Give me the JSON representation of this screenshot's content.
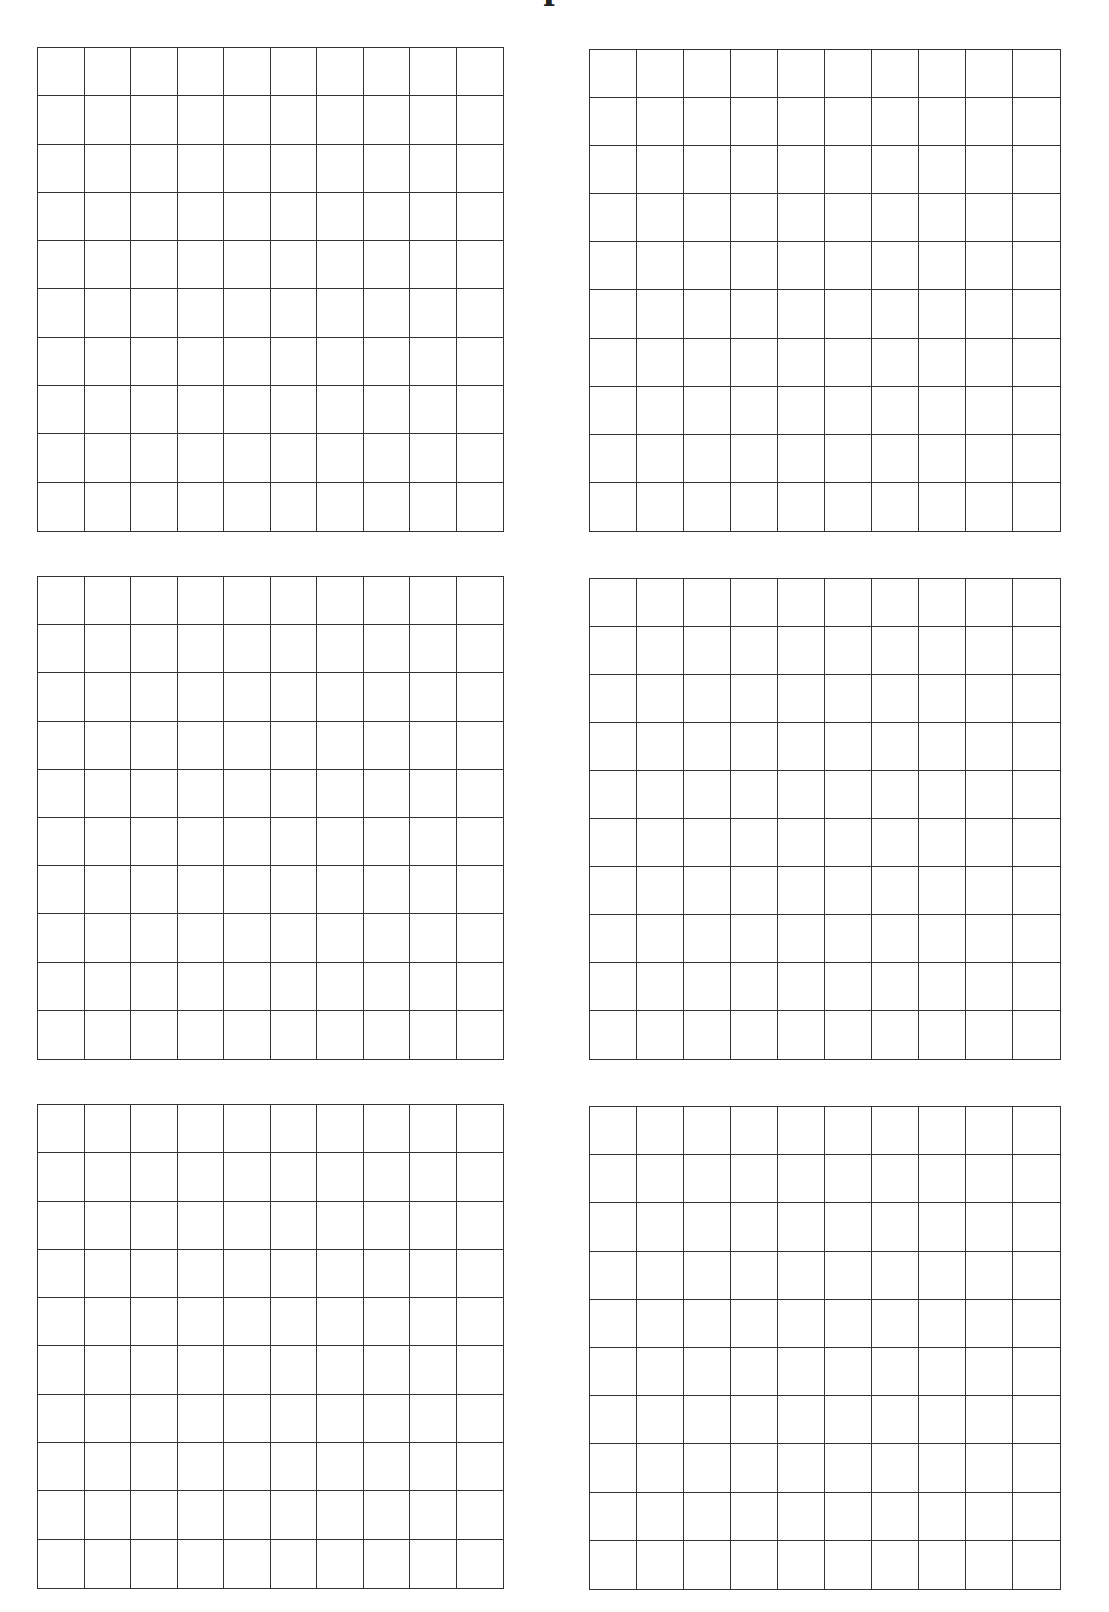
{
  "page": {
    "title": "p",
    "title_note": "title text is cropped at the top edge; only a descender glyph is visible"
  },
  "worksheet": {
    "type": "hundreds-grid",
    "grid_count": 6,
    "rows_per_grid": 10,
    "cols_per_grid": 10,
    "line_color": "#333333",
    "background_color": "#ffffff",
    "grids": [
      {
        "id": "grid-1",
        "position": "top-left"
      },
      {
        "id": "grid-2",
        "position": "top-right"
      },
      {
        "id": "grid-3",
        "position": "middle-left"
      },
      {
        "id": "grid-4",
        "position": "middle-right"
      },
      {
        "id": "grid-5",
        "position": "bottom-left"
      },
      {
        "id": "grid-6",
        "position": "bottom-right"
      }
    ]
  }
}
